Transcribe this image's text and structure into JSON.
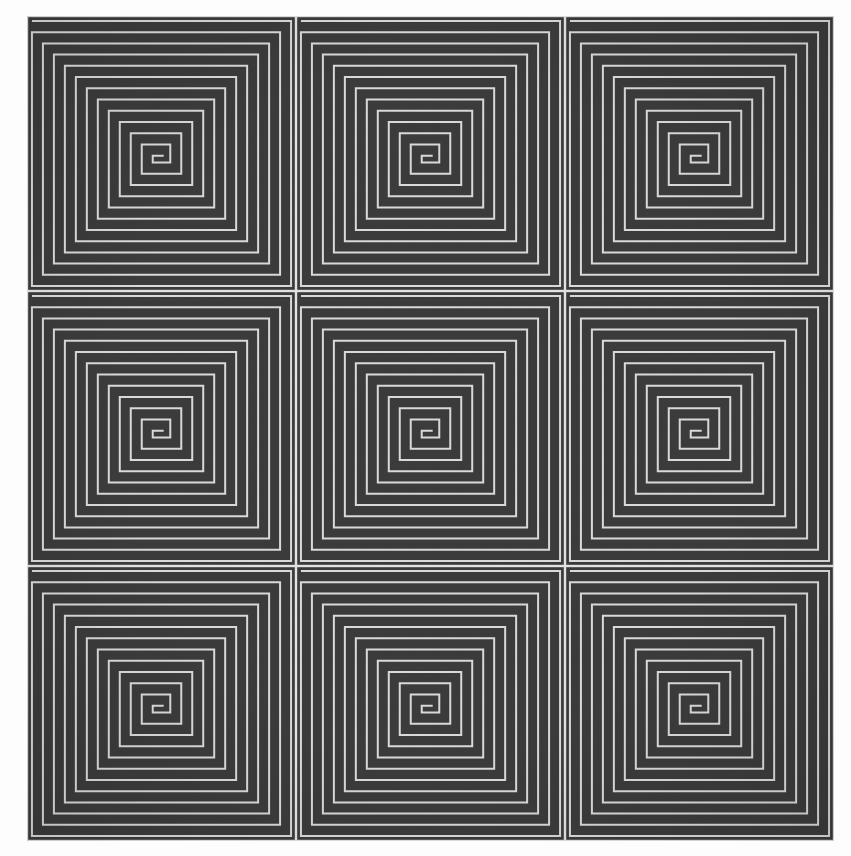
{
  "document": {
    "title": "Square Spiral Tiling",
    "caption": ""
  },
  "canvas": {
    "width": 851,
    "height": 856,
    "background_color": "#fdfdfd",
    "artwork_left": 27,
    "artwork_top": 16,
    "artwork_width": 807,
    "artwork_height": 825
  },
  "palette": {
    "page_background": "#fdfdfd",
    "tile_background": "#3b3b3b",
    "spiral_line": "#d9d9d9",
    "seam_line": "#e2e2e2",
    "dark_band": "#3a3a3a"
  },
  "chart_data": {
    "type": "heatmap",
    "subtitle": "3 x 3 grid of rectangular (square) spirals",
    "xlabel": "",
    "ylabel": "",
    "grid": false,
    "legend": "none",
    "rows": 3,
    "columns": 3,
    "tile_count": 9,
    "tile_width_px": 269,
    "tile_height_px": 275,
    "line_period_px": 11.5,
    "line_width_px": 2,
    "windings_per_tile": 12,
    "spiral_handedness": "clockwise-inward",
    "spiral_start_corner": "top-left",
    "categories": [
      "col-1",
      "col-2",
      "col-3"
    ],
    "row_labels": [
      "row-1",
      "row-2",
      "row-3"
    ],
    "values": [
      [
        12,
        12,
        12
      ],
      [
        12,
        12,
        12
      ],
      [
        12,
        12,
        12
      ]
    ],
    "tiles": [
      {
        "id": "tile-r1c1",
        "row": 1,
        "col": 1,
        "windings": 12,
        "center_x": 0.5,
        "center_y": 0.5
      },
      {
        "id": "tile-r1c2",
        "row": 1,
        "col": 2,
        "windings": 12,
        "center_x": 0.5,
        "center_y": 0.5
      },
      {
        "id": "tile-r1c3",
        "row": 1,
        "col": 3,
        "windings": 12,
        "center_x": 0.5,
        "center_y": 0.5
      },
      {
        "id": "tile-r2c1",
        "row": 2,
        "col": 1,
        "windings": 12,
        "center_x": 0.5,
        "center_y": 0.5
      },
      {
        "id": "tile-r2c2",
        "row": 2,
        "col": 2,
        "windings": 12,
        "center_x": 0.5,
        "center_y": 0.5
      },
      {
        "id": "tile-r2c3",
        "row": 2,
        "col": 3,
        "windings": 12,
        "center_x": 0.5,
        "center_y": 0.5
      },
      {
        "id": "tile-r3c1",
        "row": 3,
        "col": 1,
        "windings": 12,
        "center_x": 0.5,
        "center_y": 0.5
      },
      {
        "id": "tile-r3c2",
        "row": 3,
        "col": 2,
        "windings": 12,
        "center_x": 0.5,
        "center_y": 0.5
      },
      {
        "id": "tile-r3c3",
        "row": 3,
        "col": 3,
        "windings": 12,
        "center_x": 0.5,
        "center_y": 0.5
      }
    ]
  }
}
